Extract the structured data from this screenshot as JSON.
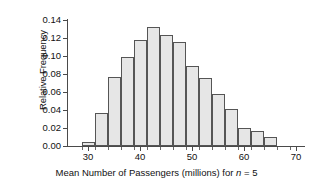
{
  "chart_data": {
    "type": "bar",
    "title": "",
    "subtitle": "",
    "xlabel_parts": {
      "before_n": "Mean Number of Passengers (millions) for ",
      "italic_n": "n",
      "after_n": " = 5"
    },
    "xlabel": "Mean Number of Passengers (millions) for n = 5",
    "ylabel": "Relative Frequency",
    "xlim": [
      26.25,
      72.0
    ],
    "ylim": [
      0.0,
      0.14
    ],
    "grid": false,
    "legend": false,
    "bin_width": 2.5,
    "bar_fill_color": "#e6e6e6",
    "bar_edge_color": "#555555",
    "axis_color": "#4a4a4a",
    "ytick_labels": [
      "0.00",
      "0.02",
      "0.04",
      "0.06",
      "0.08",
      "0.10",
      "0.12",
      "0.14"
    ],
    "ytick_values": [
      0.0,
      0.02,
      0.04,
      0.06,
      0.08,
      0.1,
      0.12,
      0.14
    ],
    "xtick_labels": [
      "30",
      "40",
      "50",
      "60",
      "70"
    ],
    "xtick_values": [
      30,
      40,
      50,
      60,
      70
    ],
    "xtick_minor_values": [
      28.75,
      31.25,
      33.75,
      36.25,
      38.75,
      41.25,
      43.75,
      46.25,
      48.75,
      51.25,
      53.75,
      56.25,
      58.75,
      61.25,
      63.75,
      66.25,
      68.75
    ],
    "bin_left_edges": [
      28.75,
      31.25,
      33.75,
      36.25,
      38.75,
      41.25,
      43.75,
      46.25,
      48.75,
      51.25,
      53.75,
      56.25,
      58.75,
      61.25,
      63.75
    ],
    "bin_centers": [
      30.0,
      32.5,
      35.0,
      37.5,
      40.0,
      42.5,
      45.0,
      47.5,
      50.0,
      52.5,
      55.0,
      57.5,
      60.0,
      62.5,
      65.0
    ],
    "categories": [
      "28.75-31.25",
      "31.25-33.75",
      "33.75-36.25",
      "36.25-38.75",
      "38.75-41.25",
      "41.25-43.75",
      "43.75-46.25",
      "46.25-48.75",
      "48.75-51.25",
      "51.25-53.75",
      "53.75-56.25",
      "56.25-58.75",
      "58.75-61.25",
      "61.25-63.75",
      "63.75-66.25"
    ],
    "values": [
      0.004,
      0.037,
      0.076,
      0.099,
      0.117,
      0.132,
      0.123,
      0.115,
      0.089,
      0.075,
      0.057,
      0.041,
      0.02,
      0.017,
      0.01
    ]
  }
}
